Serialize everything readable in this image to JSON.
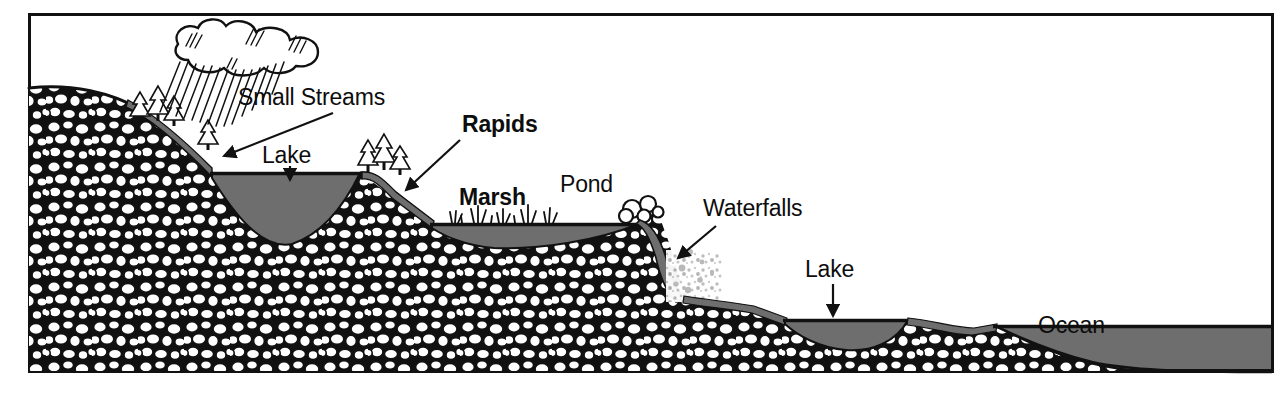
{
  "figure": {
    "type": "schematic-cross-section",
    "background_color": "#ffffff",
    "frame": {
      "stroke_color": "#111111",
      "stroke_width": 3,
      "x": 28,
      "y": 13,
      "width": 1245,
      "height": 359
    },
    "palette": {
      "ink": "#111111",
      "water_fill": "#6e6e6e",
      "water_edge": "#111111",
      "rock_outline": "#111111",
      "rock_fill": "#ffffff",
      "spray_gray": "#b9b9b9",
      "soil_band": "#6e6e6e"
    }
  },
  "labels": [
    {
      "id": "small-streams",
      "text": "Small Streams",
      "x": 238,
      "y": 105,
      "bold": false,
      "leader": {
        "type": "arrow",
        "x1": 333,
        "y1": 113,
        "x2": 222,
        "y2": 155
      }
    },
    {
      "id": "lake-upper",
      "text": "Lake",
      "x": 262,
      "y": 163,
      "bold": false,
      "leader": {
        "type": "arrow-down",
        "x1": 290,
        "y1": 166,
        "x2": 290,
        "y2": 180
      }
    },
    {
      "id": "rapids",
      "text": "Rapids",
      "x": 462,
      "y": 132,
      "bold": true,
      "leader": {
        "type": "arrow",
        "x1": 460,
        "y1": 140,
        "x2": 404,
        "y2": 190
      }
    },
    {
      "id": "marsh",
      "text": "Marsh",
      "x": 459,
      "y": 205,
      "bold": true,
      "leader": null
    },
    {
      "id": "pond",
      "text": "Pond",
      "x": 560,
      "y": 192,
      "bold": false,
      "leader": null
    },
    {
      "id": "waterfalls",
      "text": "Waterfalls",
      "x": 703,
      "y": 216,
      "bold": false,
      "leader": {
        "type": "arrow",
        "x1": 714,
        "y1": 224,
        "x2": 677,
        "y2": 256
      }
    },
    {
      "id": "lake-lower",
      "text": "Lake",
      "x": 805,
      "y": 277,
      "bold": false,
      "leader": {
        "type": "arrow-down",
        "x1": 833,
        "y1": 283,
        "x2": 833,
        "y2": 315
      }
    },
    {
      "id": "ocean",
      "text": "Ocean",
      "x": 1038,
      "y": 333,
      "bold": false,
      "leader": null
    }
  ],
  "features": {
    "cloud": {
      "name": "rain-cloud",
      "cx": 232,
      "cy": 48
    },
    "rain": {
      "name": "rain-hatching",
      "count": 14
    },
    "conifers_upper": {
      "count": 4
    },
    "conifers_lake": {
      "count": 3
    },
    "water_bodies": [
      {
        "name": "upper-lake",
        "surface_y": 173,
        "from_x": 212,
        "to_x": 360
      },
      {
        "name": "marsh-pond",
        "surface_y": 224,
        "from_x": 432,
        "to_x": 638
      },
      {
        "name": "lower-lake",
        "surface_y": 320,
        "from_x": 785,
        "to_x": 908
      },
      {
        "name": "ocean",
        "surface_y": 326,
        "from_x": 995,
        "to_x": 1273
      }
    ]
  }
}
